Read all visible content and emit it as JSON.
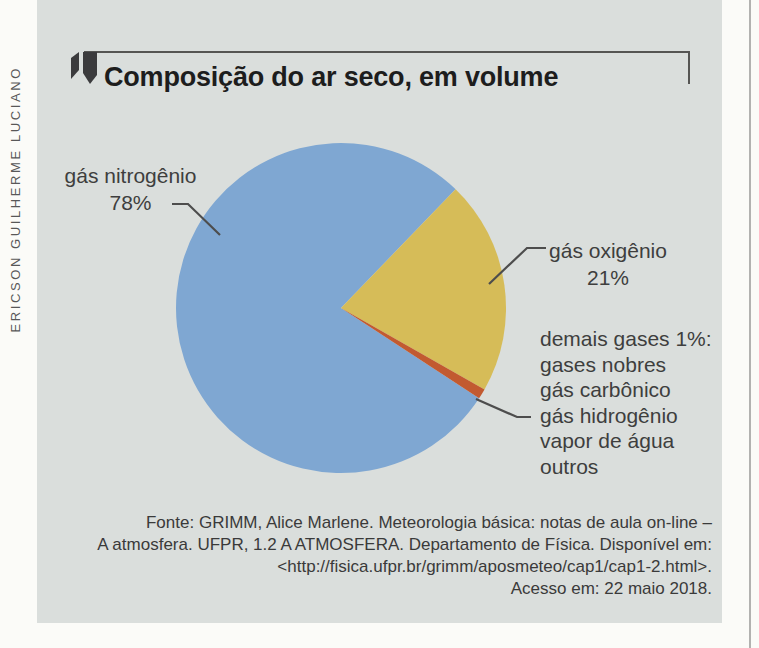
{
  "figure": {
    "credit": "ERICSON GUILHERME LUCIANO",
    "title": "Composição do ar seco, em volume",
    "source_lines": [
      "Fonte: GRIMM, Alice Marlene. Meteorologia básica: notas de aula on-line –",
      "A atmosfera. UFPR, 1.2 A ATMOSFERA. Departamento de Física. Disponível em:",
      "<http://fisica.ufpr.br/grimm/aposmeteo/cap1/cap1-2.html>.",
      "Acesso em: 22 maio 2018."
    ]
  },
  "labels": {
    "nitrogen": {
      "name": "gás nitrogênio",
      "pct": "78%"
    },
    "oxygen": {
      "name": "gás oxigênio",
      "pct": "21%"
    },
    "others_lines": [
      "demais gases 1%:",
      "gases nobres",
      "gás carbônico",
      "gás hidrogênio",
      "vapor de água",
      "outros"
    ]
  },
  "chart_data": {
    "type": "pie",
    "title": "Composição do ar seco, em volume",
    "start_angle_deg": -33.2,
    "direction": "clockwise",
    "legend_position": "callout-labels",
    "slices": [
      {
        "id": "nitrogenio",
        "label": "gás nitrogênio",
        "value_pct": 78,
        "color": "#7fa7d2"
      },
      {
        "id": "oxigenio",
        "label": "gás oxigênio",
        "value_pct": 21,
        "color": "#d6bc58"
      },
      {
        "id": "demais-gases",
        "label": "demais gases (gases nobres, gás carbônico, gás hidrogênio, vapor de água, outros)",
        "value_pct": 1,
        "color": "#c25a30"
      }
    ],
    "colors": {
      "panel_background": "#dadedc",
      "title_text": "#1d1d1d",
      "label_text": "#3e3e3e",
      "leader_line": "#4d4d4d"
    }
  }
}
